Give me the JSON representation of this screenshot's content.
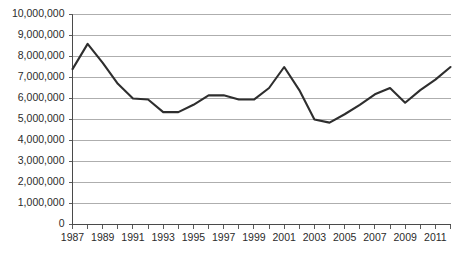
{
  "chart_data": {
    "type": "line",
    "title": "",
    "subtitle": "",
    "xlabel": "",
    "ylabel": "",
    "x": [
      1987,
      1988,
      1989,
      1990,
      1991,
      1992,
      1993,
      1994,
      1995,
      1996,
      1997,
      1998,
      1999,
      2000,
      2001,
      2002,
      2003,
      2004,
      2005,
      2006,
      2007,
      2008,
      2009,
      2010,
      2011,
      2012
    ],
    "series": [
      {
        "name": "Series 1",
        "values": [
          7400000,
          8600000,
          7700000,
          6700000,
          6000000,
          5950000,
          5350000,
          5350000,
          5700000,
          6150000,
          6150000,
          5950000,
          5950000,
          6500000,
          7500000,
          6400000,
          5000000,
          4850000,
          5250000,
          5700000,
          6200000,
          6500000,
          5800000,
          6400000,
          6900000,
          7500000
        ]
      }
    ],
    "x_tick_labels": [
      "1987",
      "1989",
      "1991",
      "1993",
      "1995",
      "1997",
      "1999",
      "2001",
      "2003",
      "2005",
      "2007",
      "2009",
      "2011"
    ],
    "y_tick_labels": [
      "10,000,000",
      "9,000,000",
      "8,000,000",
      "7,000,000",
      "6,000,000",
      "5,000,000",
      "4,000,000",
      "3,000,000",
      "2,000,000",
      "1,000,000",
      "0"
    ],
    "y_tick_values": [
      10000000,
      9000000,
      8000000,
      7000000,
      6000000,
      5000000,
      4000000,
      3000000,
      2000000,
      1000000,
      0
    ],
    "ylim": [
      0,
      10000000
    ],
    "xlim": [
      1987,
      2012
    ],
    "grid": "horizontal",
    "legend": "none",
    "line_color": "#2e2e2e",
    "gridline_color": "#9a9a9a",
    "axis_color": "#4a4a4a",
    "background_color": "#ffffff"
  }
}
